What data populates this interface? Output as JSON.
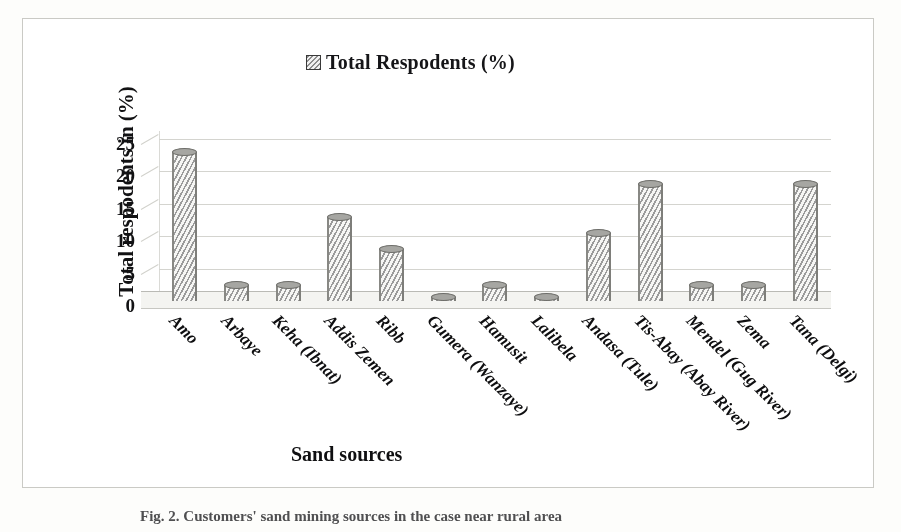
{
  "figure": {
    "caption": "Fig. 2.  Customers' sand mining sources in the case near rural area",
    "border_color": "#c9c9c4"
  },
  "legend": {
    "position": "top-center",
    "swatch_icon": "hatched-square-icon",
    "label": "Total   Respodents (%)"
  },
  "axes": {
    "y_title": "Total  respodents in (%)",
    "x_title": "Sand sources"
  },
  "chart_data": {
    "type": "bar",
    "title": "",
    "subtitle": "",
    "xlabel": "Sand sources",
    "ylabel": "Total  respodents in (%)",
    "ylim": [
      0,
      25
    ],
    "yticks": [
      0,
      5,
      10,
      15,
      20,
      25
    ],
    "grid": true,
    "legend_position": "top-center",
    "style": "3d-cylinder-hatched",
    "series": [
      {
        "name": "Total   Respodents (%)",
        "values": [
          23,
          2.5,
          2.5,
          13,
          8,
          0.3,
          2.5,
          0.3,
          10.5,
          18,
          2.5,
          2.5,
          18
        ]
      }
    ],
    "categories": [
      "Amo",
      "Arbaye",
      "Keha (Ibnat)",
      "Addis Zemen",
      "Ribb",
      "Gumera (Wanzaye)",
      "Hamusit",
      "Lalibela",
      "Andasa (Tule)",
      "Tis-Abay (Abay River)",
      "Mendel (Gug River)",
      "Zema",
      "Tana (Delgi)"
    ],
    "colors": {
      "bar_fill": "#f4f4f2",
      "bar_hatch": "#9a9a9a",
      "bar_outline": "#7e7e7a",
      "gridline": "#d2d2cd",
      "text": "#141416",
      "background": "#fefefd"
    }
  }
}
